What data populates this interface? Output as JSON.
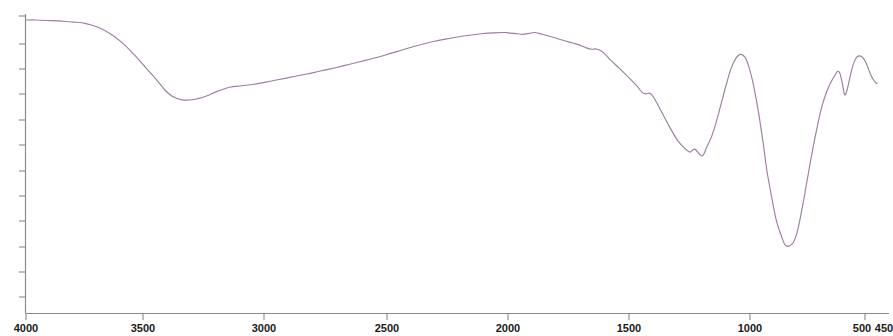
{
  "chart_data": {
    "type": "line",
    "title": "",
    "subtitle": "",
    "xlabel": "",
    "ylabel": "",
    "grid": false,
    "legend": false,
    "legend_position": "none",
    "x_axis": {
      "reversed": true,
      "range": [
        4000,
        450
      ],
      "tick_labels": [
        "4000",
        "3500",
        "3000",
        "2500",
        "2000",
        "1500",
        "1000",
        "500",
        "450"
      ],
      "tick_values": [
        4000,
        3500,
        3000,
        2500,
        2000,
        1500,
        1000,
        500,
        450
      ],
      "unit": "cm-1"
    },
    "y_axis": {
      "range": [
        0,
        100
      ],
      "tick_labels": [],
      "tick_count": 13,
      "unit": "%T"
    },
    "series": [
      {
        "name": "IR transmittance",
        "color": "#9b7f9e",
        "x": [
          4000,
          3960,
          3900,
          3850,
          3800,
          3750,
          3700,
          3650,
          3600,
          3550,
          3500,
          3450,
          3420,
          3390,
          3350,
          3300,
          3250,
          3200,
          3150,
          3100,
          3050,
          3000,
          2950,
          2900,
          2850,
          2800,
          2750,
          2700,
          2650,
          2600,
          2550,
          2500,
          2450,
          2400,
          2350,
          2300,
          2250,
          2200,
          2150,
          2100,
          2050,
          2000,
          1980,
          1950,
          1930,
          1900,
          1880,
          1850,
          1800,
          1760,
          1720,
          1690,
          1660,
          1640,
          1620,
          1600,
          1580,
          1560,
          1520,
          1480,
          1450,
          1430,
          1415,
          1405,
          1395,
          1385,
          1370,
          1340,
          1310,
          1280,
          1250,
          1230,
          1210,
          1180,
          1160,
          1140,
          1120,
          1100,
          1080,
          1060,
          1040,
          1020,
          1000,
          985,
          970,
          955,
          940,
          925,
          910,
          890,
          870,
          850,
          830,
          800,
          780,
          760,
          740,
          720,
          700,
          680,
          660,
          640,
          625,
          615,
          605,
          595,
          585,
          575,
          565,
          555,
          545,
          535,
          525,
          515,
          505,
          495,
          485,
          475,
          465,
          455,
          450
        ],
        "y": [
          98,
          98,
          97.8,
          97.6,
          97.3,
          96.8,
          95.6,
          93.5,
          90.5,
          86.5,
          82,
          77.5,
          74.5,
          72.5,
          71.3,
          71.4,
          72.5,
          74.2,
          75.5,
          76,
          76.5,
          77.2,
          78,
          78.8,
          79.6,
          80.4,
          81.3,
          82.2,
          83.2,
          84.2,
          85.2,
          86.3,
          87.5,
          88.7,
          89.8,
          90.8,
          91.6,
          92.3,
          92.9,
          93.4,
          93.7,
          93.8,
          93.6,
          93.4,
          93.2,
          93.5,
          93.8,
          93.3,
          92.2,
          91.2,
          90.3,
          89.6,
          88.6,
          88.2,
          88.3,
          87.6,
          86.2,
          84.5,
          81.5,
          78.3,
          75.8,
          73.8,
          73.3,
          73.5,
          73.4,
          72.5,
          70.5,
          66,
          61.5,
          57.5,
          55,
          53.8,
          54.8,
          52.5,
          55.5,
          59,
          64,
          70,
          76,
          81.5,
          85,
          86.5,
          85.5,
          82.5,
          78,
          72,
          65,
          57,
          48,
          39,
          31,
          26,
          22.5,
          23.5,
          28,
          36,
          45,
          54,
          62,
          69,
          74,
          77.5,
          79.5,
          80.8,
          80.2,
          77,
          73,
          74.5,
          78,
          81.5,
          84,
          85.5,
          86,
          85.8,
          85,
          83.5,
          81.5,
          79.5,
          78,
          77,
          76.8
        ]
      }
    ],
    "annotations": [],
    "features": {
      "broad_band_min_cm1": 3350,
      "main_min_cm1": 1050,
      "secondary_minima_cm1": [
        1420,
        1390,
        620,
        580
      ]
    }
  },
  "colors": {
    "trace": "#9b7f9e",
    "axis": "#8a8a8a",
    "label": "#1a1a1a",
    "background": "#ffffff"
  }
}
